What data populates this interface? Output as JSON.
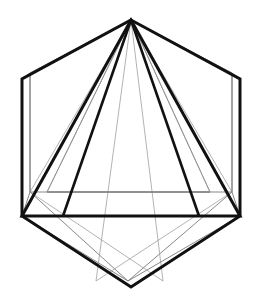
{
  "document": {
    "title": "Polyhedron line drawing",
    "background_color": "#ffffff",
    "canvas": {
      "width": 267,
      "height": 299
    }
  },
  "style": {
    "primary_stroke_color": "#111111",
    "secondary_stroke_color": "#7a7a7a",
    "faint_stroke_color": "#9a9a9a",
    "primary_stroke_width": 3.0,
    "secondary_stroke_width": 0.9,
    "faint_stroke_width": 0.75,
    "fill": "none"
  },
  "chart_data": {
    "type": "line",
    "xlabel": "",
    "ylabel": "",
    "xlim": [
      0,
      267
    ],
    "ylim": [
      0,
      299
    ],
    "grid": false,
    "legend": "none",
    "series": [
      {
        "name": "hexagon-outline",
        "stroke": "#111111",
        "width": 3.0,
        "closed": true,
        "points": [
          [
            131,
            20
          ],
          [
            240,
            79
          ],
          [
            240,
            216
          ],
          [
            131,
            287
          ],
          [
            22,
            216
          ],
          [
            22,
            79
          ]
        ]
      },
      {
        "name": "inscribed-triangle",
        "stroke": "#111111",
        "width": 3.0,
        "closed": true,
        "points": [
          [
            131,
            20
          ],
          [
            240,
            216
          ],
          [
            22,
            216
          ]
        ]
      },
      {
        "name": "inner-triangle-left-edge",
        "stroke": "#111111",
        "width": 2.6,
        "closed": false,
        "points": [
          [
            131,
            20
          ],
          [
            63,
            216
          ]
        ]
      },
      {
        "name": "inner-triangle-right-edge",
        "stroke": "#111111",
        "width": 2.6,
        "closed": false,
        "points": [
          [
            131,
            20
          ],
          [
            199,
            216
          ]
        ]
      },
      {
        "name": "ghost-hexagon-outline",
        "stroke": "#7a7a7a",
        "width": 0.9,
        "closed": true,
        "points": [
          [
            131,
            20
          ],
          [
            232,
            73
          ],
          [
            232,
            192
          ],
          [
            128,
            281
          ],
          [
            30,
            192
          ],
          [
            30,
            73
          ]
        ]
      },
      {
        "name": "ghost-triangle",
        "stroke": "#7a7a7a",
        "width": 0.9,
        "closed": true,
        "points": [
          [
            131,
            20
          ],
          [
            210,
            192
          ],
          [
            47,
            192
          ]
        ]
      },
      {
        "name": "ghost-edge-apex-to-lower-left",
        "stroke": "#9a9a9a",
        "width": 0.75,
        "closed": false,
        "points": [
          [
            131,
            20
          ],
          [
            30,
            192
          ]
        ]
      },
      {
        "name": "ghost-edge-apex-to-lower-right",
        "stroke": "#9a9a9a",
        "width": 0.75,
        "closed": false,
        "points": [
          [
            131,
            20
          ],
          [
            232,
            192
          ]
        ]
      },
      {
        "name": "ghost-edge-apex-to-base-left",
        "stroke": "#9a9a9a",
        "width": 0.75,
        "closed": false,
        "points": [
          [
            131,
            20
          ],
          [
            96,
            281
          ]
        ]
      },
      {
        "name": "ghost-edge-apex-to-base-right",
        "stroke": "#9a9a9a",
        "width": 0.75,
        "closed": false,
        "points": [
          [
            131,
            20
          ],
          [
            163,
            281
          ]
        ]
      },
      {
        "name": "ghost-edge-apex-to-left-upper",
        "stroke": "#9a9a9a",
        "width": 0.75,
        "closed": false,
        "points": [
          [
            131,
            20
          ],
          [
            30,
            73
          ]
        ]
      },
      {
        "name": "ghost-edge-apex-to-right-upper",
        "stroke": "#9a9a9a",
        "width": 0.75,
        "closed": false,
        "points": [
          [
            131,
            20
          ],
          [
            232,
            73
          ]
        ]
      },
      {
        "name": "ghost-diagonal-left-to-base",
        "stroke": "#9a9a9a",
        "width": 0.75,
        "closed": false,
        "points": [
          [
            30,
            192
          ],
          [
            163,
            281
          ]
        ]
      },
      {
        "name": "ghost-diagonal-right-to-base",
        "stroke": "#9a9a9a",
        "width": 0.75,
        "closed": false,
        "points": [
          [
            232,
            192
          ],
          [
            96,
            281
          ]
        ]
      },
      {
        "name": "ghost-left-vertical",
        "stroke": "#7a7a7a",
        "width": 0.9,
        "closed": false,
        "points": [
          [
            30,
            73
          ],
          [
            30,
            192
          ]
        ]
      },
      {
        "name": "ghost-right-vertical",
        "stroke": "#7a7a7a",
        "width": 0.9,
        "closed": false,
        "points": [
          [
            232,
            73
          ],
          [
            232,
            192
          ]
        ]
      },
      {
        "name": "ghost-horizontal-mid",
        "stroke": "#7a7a7a",
        "width": 0.9,
        "closed": false,
        "points": [
          [
            30,
            192
          ],
          [
            232,
            192
          ]
        ]
      },
      {
        "name": "base-inner-horizontal",
        "stroke": "#7a7a7a",
        "width": 0.9,
        "closed": false,
        "points": [
          [
            47,
            192
          ],
          [
            210,
            192
          ]
        ]
      },
      {
        "name": "corner-tick-left-top",
        "stroke": "#7a7a7a",
        "width": 0.9,
        "closed": false,
        "points": [
          [
            22,
            79
          ],
          [
            30,
            73
          ]
        ]
      },
      {
        "name": "corner-tick-right-top",
        "stroke": "#7a7a7a",
        "width": 0.9,
        "closed": false,
        "points": [
          [
            240,
            79
          ],
          [
            232,
            73
          ]
        ]
      },
      {
        "name": "corner-tick-left-bottom",
        "stroke": "#7a7a7a",
        "width": 0.9,
        "closed": false,
        "points": [
          [
            22,
            216
          ],
          [
            30,
            192
          ]
        ]
      },
      {
        "name": "corner-tick-right-bottom",
        "stroke": "#7a7a7a",
        "width": 0.9,
        "closed": false,
        "points": [
          [
            240,
            216
          ],
          [
            232,
            192
          ]
        ]
      },
      {
        "name": "ghost-base-left-diag",
        "stroke": "#7a7a7a",
        "width": 0.9,
        "closed": false,
        "points": [
          [
            22,
            216
          ],
          [
            128,
            281
          ]
        ]
      },
      {
        "name": "ghost-base-right-diag",
        "stroke": "#7a7a7a",
        "width": 0.9,
        "closed": false,
        "points": [
          [
            240,
            216
          ],
          [
            128,
            281
          ]
        ]
      },
      {
        "name": "ghost-triangle-left-inner",
        "stroke": "#9a9a9a",
        "width": 0.75,
        "closed": false,
        "points": [
          [
            131,
            20
          ],
          [
            47,
            192
          ]
        ]
      },
      {
        "name": "ghost-triangle-right-inner",
        "stroke": "#9a9a9a",
        "width": 0.75,
        "closed": false,
        "points": [
          [
            131,
            20
          ],
          [
            210,
            192
          ]
        ]
      }
    ]
  }
}
